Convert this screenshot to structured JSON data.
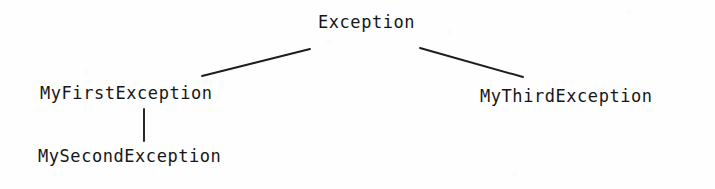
{
  "diagram": {
    "type": "class-hierarchy-tree",
    "background_color": "#fefefe",
    "ink_color": "#161616",
    "nodes": [
      {
        "id": "exception",
        "label": "Exception",
        "x": 318,
        "y": 14,
        "level": 0
      },
      {
        "id": "my-first-exception",
        "label": "MyFirstException",
        "x": 40,
        "y": 85,
        "level": 1
      },
      {
        "id": "my-third-exception",
        "label": "MyThirdException",
        "x": 480,
        "y": 88,
        "level": 1
      },
      {
        "id": "my-second-exception",
        "label": "MySecondException",
        "x": 38,
        "y": 148,
        "level": 2
      }
    ],
    "edges": [
      {
        "id": "edge-exception-myfirst",
        "from": "exception",
        "to": "my-first-exception",
        "kind": "diagonal",
        "x1": 310,
        "y1": 49,
        "x2": 202,
        "y2": 76
      },
      {
        "id": "edge-exception-mythird",
        "from": "exception",
        "to": "my-third-exception",
        "kind": "diagonal",
        "x1": 420,
        "y1": 48,
        "x2": 523,
        "y2": 77
      },
      {
        "id": "edge-myfirst-mysecond",
        "from": "my-first-exception",
        "to": "my-second-exception",
        "kind": "vertical",
        "x1": 144,
        "y1": 109,
        "x2": 144,
        "y2": 141
      }
    ]
  }
}
